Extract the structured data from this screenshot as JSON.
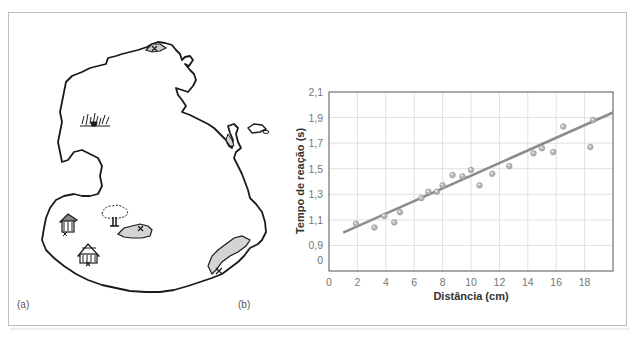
{
  "panels": {
    "a": {
      "label": "(a)",
      "description": "Hand-drawn island map with landmarks"
    },
    "b": {
      "label": "(b)"
    }
  },
  "map": {
    "landmarks": [
      {
        "name": "grass-tuft",
        "x": 95,
        "y": 122
      },
      {
        "name": "hut",
        "x": 68,
        "y": 223
      },
      {
        "name": "tree",
        "x": 115,
        "y": 215
      },
      {
        "name": "pond",
        "x": 135,
        "y": 232
      },
      {
        "name": "tent-house",
        "x": 88,
        "y": 253
      },
      {
        "name": "beach-shore",
        "x": 230,
        "y": 250
      },
      {
        "name": "north-rock",
        "x": 158,
        "y": 47
      },
      {
        "name": "east-islet",
        "x": 256,
        "y": 128
      }
    ],
    "colors": {
      "outline": "#1a1a1a",
      "fill_gray": "#d4d4d4"
    }
  },
  "chart_data": {
    "type": "scatter",
    "title": "",
    "xlabel": "Distância (cm)",
    "ylabel": "Tempo de reação (s)",
    "x_ticks": [
      "0",
      "2",
      "4",
      "6",
      "8",
      "10",
      "12",
      "14",
      "16",
      "18"
    ],
    "y_ticks": [
      "0",
      "0,9",
      "1,1",
      "1,3",
      "1,5",
      "1,7",
      "1,9",
      "2,1"
    ],
    "xlim": [
      0,
      20
    ],
    "ylim": [
      0,
      2.1
    ],
    "y_axis_break": "0 to 0.9 compressed (0 placed one half-step below 0.9)",
    "grid": true,
    "legend": null,
    "series": [
      {
        "name": "observações",
        "points": [
          [
            1.9,
            1.07
          ],
          [
            3.2,
            1.04
          ],
          [
            3.9,
            1.13
          ],
          [
            4.6,
            1.08
          ],
          [
            5.0,
            1.16
          ],
          [
            6.5,
            1.27
          ],
          [
            7.0,
            1.32
          ],
          [
            7.6,
            1.32
          ],
          [
            8.0,
            1.37
          ],
          [
            8.7,
            1.45
          ],
          [
            9.4,
            1.44
          ],
          [
            10.0,
            1.49
          ],
          [
            10.6,
            1.37
          ],
          [
            11.5,
            1.46
          ],
          [
            12.7,
            1.52
          ],
          [
            14.4,
            1.62
          ],
          [
            15.0,
            1.66
          ],
          [
            15.8,
            1.63
          ],
          [
            16.5,
            1.83
          ],
          [
            18.4,
            1.67
          ],
          [
            18.6,
            1.88
          ]
        ]
      }
    ],
    "trend_line": {
      "from": [
        1.0,
        1.0
      ],
      "to": [
        20.0,
        1.94
      ]
    },
    "colors": {
      "points": "#b8b8b8",
      "line": "#8c8c8c",
      "grid": "#e0e0e0",
      "axis": "#555555"
    }
  }
}
